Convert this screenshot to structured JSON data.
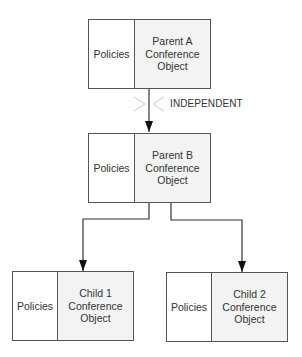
{
  "diagram": {
    "nodes": [
      {
        "id": "parent-a",
        "policies_label": "Policies",
        "object_label": "Parent A\nConference\nObject"
      },
      {
        "id": "parent-b",
        "policies_label": "Policies",
        "object_label": "Parent B\nConference\nObject"
      },
      {
        "id": "child-1",
        "policies_label": "Policies",
        "object_label": "Child 1\nConference\nObject"
      },
      {
        "id": "child-2",
        "policies_label": "Policies",
        "object_label": "Child 2\nConference\nObject"
      }
    ],
    "edges": [
      {
        "from": "parent-a",
        "to": "parent-b",
        "label": "INDEPENDENT",
        "broken": true
      },
      {
        "from": "parent-b",
        "to": "child-1"
      },
      {
        "from": "parent-b",
        "to": "child-2"
      }
    ],
    "colors": {
      "line": "#555555",
      "object_fill": "#f3f3f3",
      "break_mark": "#c8c8c8"
    }
  }
}
